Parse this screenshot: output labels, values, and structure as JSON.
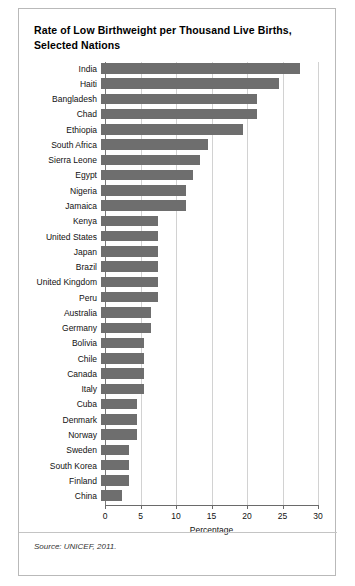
{
  "figure": {
    "title": "Rate of Low Birthweight per Thousand Live Births, Selected Nations",
    "source": "Source: UNICEF, 2011."
  },
  "chart_data": {
    "type": "bar",
    "orientation": "horizontal",
    "title": "Rate of Low Birthweight per Thousand Live Births, Selected Nations",
    "xlabel": "Percentage",
    "ylabel": "",
    "xlim": [
      0,
      30
    ],
    "xticks": [
      0,
      5,
      10,
      15,
      20,
      25,
      30
    ],
    "xtick_labels": [
      "0",
      "5",
      "10",
      "15",
      "20",
      "25",
      "30"
    ],
    "grid": "vertical",
    "legend": "none",
    "bar_color": "#6e6e6e",
    "categories": [
      "India",
      "Haiti",
      "Bangladesh",
      "Chad",
      "Ethiopia",
      "South Africa",
      "Sierra Leone",
      "Egypt",
      "Nigeria",
      "Jamaica",
      "Kenya",
      "United States",
      "Japan",
      "Brazil",
      "United Kingdom",
      "Peru",
      "Australia",
      "Germany",
      "Bolivia",
      "Chile",
      "Canada",
      "Italy",
      "Cuba",
      "Denmark",
      "Norway",
      "Sweden",
      "South Korea",
      "Finland",
      "China"
    ],
    "values": [
      28,
      25,
      22,
      22,
      20,
      15,
      14,
      13,
      12,
      12,
      8,
      8,
      8,
      8,
      8,
      8,
      7,
      7,
      6,
      6,
      6,
      6,
      5,
      5,
      5,
      4,
      4,
      4,
      3
    ],
    "source": "Source: UNICEF, 2011."
  }
}
